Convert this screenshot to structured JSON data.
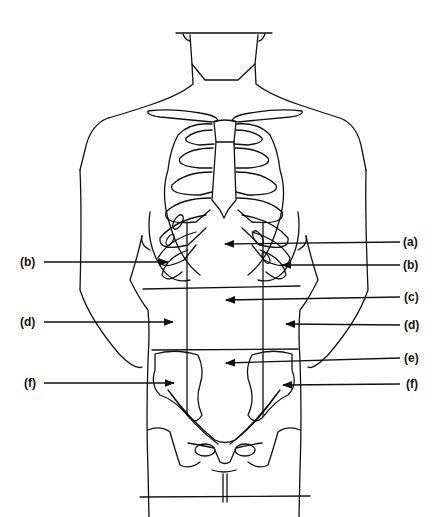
{
  "diagram": {
    "labels_left": [
      {
        "id": "b-left",
        "text": "(b)",
        "x": 24,
        "y": 255
      },
      {
        "id": "d-left",
        "text": "(d)",
        "x": 24,
        "y": 315
      },
      {
        "id": "f-left",
        "text": "(f)",
        "x": 27,
        "y": 376
      }
    ],
    "labels_right": [
      {
        "id": "a",
        "text": "(a)",
        "x": 402,
        "y": 233
      },
      {
        "id": "b-right",
        "text": "(b)",
        "x": 402,
        "y": 256
      },
      {
        "id": "c",
        "text": "(c)",
        "x": 403,
        "y": 291
      },
      {
        "id": "d-right",
        "text": "(d)",
        "x": 403,
        "y": 315
      },
      {
        "id": "e",
        "text": "(e)",
        "x": 403,
        "y": 350
      },
      {
        "id": "f-right",
        "text": "(f)",
        "x": 405,
        "y": 376
      }
    ],
    "line_color": "#111111"
  }
}
